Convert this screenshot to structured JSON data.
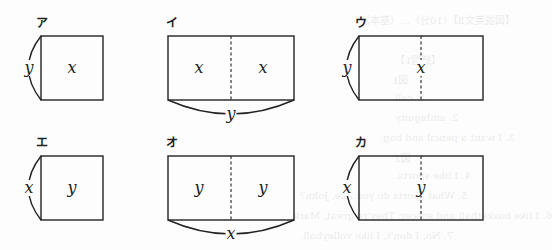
{
  "figure": {
    "type": "area-model-diagrams",
    "panels": [
      {
        "label": "ア",
        "shape": "square",
        "inside": [
          "x"
        ],
        "side_label": "y",
        "side_position": "left",
        "divided": false
      },
      {
        "label": "イ",
        "shape": "rectangle-2-parts",
        "inside": [
          "x",
          "x"
        ],
        "side_label": "y",
        "side_position": "bottom",
        "divided": true
      },
      {
        "label": "ウ",
        "shape": "rectangle",
        "inside": [
          "x"
        ],
        "side_label": "y",
        "side_position": "left",
        "divided": true
      },
      {
        "label": "エ",
        "shape": "square",
        "inside": [
          "y"
        ],
        "side_label": "x",
        "side_position": "left",
        "divided": false
      },
      {
        "label": "オ",
        "shape": "rectangle-2-parts",
        "inside": [
          "y",
          "y"
        ],
        "side_label": "x",
        "side_position": "bottom",
        "divided": true
      },
      {
        "label": "カ",
        "shape": "rectangle",
        "inside": [
          "y"
        ],
        "side_label": "x",
        "side_position": "left",
        "divided": true
      }
    ]
  },
  "bleed_through": [
    "【図説英文Ⅱ】（10分）…（基本）",
    "【練習1】",
    "図1",
    "1. call",
    "2. ambiguity",
    "3. I want a pencil and bag.",
    "図2",
    "4. I like sports.",
    "5. What sports do you like, John?",
    "6. I like basketball and soccer. They're great, Mark.",
    "7. No, I don't. I like volleyball."
  ],
  "colors": {
    "ink": "#222222",
    "paper": "#fdfdfd"
  }
}
